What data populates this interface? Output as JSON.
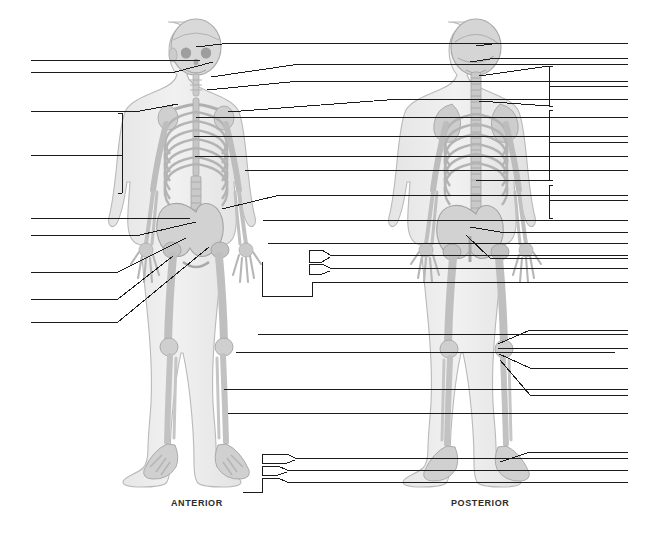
{
  "page": {
    "width": 659,
    "height": 536,
    "background_color": "#ffffff",
    "line_color": "#1a1a1a",
    "bone_fill_color": "#d4d4d4",
    "bone_outline_color": "#9a9a9a",
    "body_fill_color": "#ececec",
    "body_outline_color": "#b0b0b0"
  },
  "captions": {
    "anterior": "ANTERIOR",
    "posterior": "POSTERIOR"
  },
  "figures": [
    {
      "name": "anterior-skeleton",
      "caption": "ANTERIOR",
      "center_x": 196,
      "label_count": 22
    },
    {
      "name": "posterior-skeleton",
      "caption": "POSTERIOR",
      "center_x": 476,
      "label_count": 16
    }
  ],
  "leader_lines": {
    "left_column": [
      {
        "id": "l1",
        "answer": "",
        "x_start": 31,
        "y": 60,
        "x_end": 200,
        "target_x": 200,
        "target_y": 60
      },
      {
        "id": "l2",
        "answer": "",
        "x_start": 31,
        "y": 72,
        "x_end": 213,
        "target_x": 213,
        "target_y": 72
      },
      {
        "id": "l3",
        "answer": "",
        "x_start": 31,
        "y": 111,
        "x_end": 178,
        "target_x": 178,
        "target_y": 111
      },
      {
        "id": "l4",
        "answer": "",
        "x_start": 31,
        "y": 155,
        "x_end": 118,
        "target_x": 118,
        "target_y": 155
      },
      {
        "id": "l5",
        "answer": "",
        "x_start": 31,
        "y": 218,
        "x_end": 200,
        "target_x": 200,
        "target_y": 218
      },
      {
        "id": "l6",
        "answer": "",
        "x_start": 31,
        "y": 235,
        "x_end": 173,
        "target_x": 173,
        "target_y": 228
      },
      {
        "id": "l7",
        "answer": "",
        "x_start": 31,
        "y": 272,
        "x_end": 163,
        "target_x": 193,
        "target_y": 250
      },
      {
        "id": "l8",
        "answer": "",
        "x_start": 31,
        "y": 299,
        "x_end": 163,
        "target_x": 186,
        "target_y": 262
      },
      {
        "id": "l9",
        "answer": "",
        "x_start": 31,
        "y": 322,
        "x_end": 163,
        "target_x": 208,
        "target_y": 245
      }
    ],
    "right_column": [
      {
        "id": "r1",
        "answer": "",
        "x_end": 628,
        "y": 43,
        "x_start": 231,
        "target_x": 231,
        "target_y": 43
      },
      {
        "id": "r2",
        "answer": "",
        "x_end": 628,
        "y": 64,
        "x_start": 237,
        "target_x": 211,
        "target_y": 77
      },
      {
        "id": "r3",
        "answer": "",
        "x_end": 628,
        "y": 81,
        "x_start": 237,
        "target_x": 209,
        "target_y": 89
      },
      {
        "id": "r4",
        "answer": "",
        "x_end": 628,
        "y": 99,
        "x_start": 302,
        "target_x": 228,
        "target_y": 112
      },
      {
        "id": "r5",
        "answer": "",
        "x_end": 628,
        "y": 117,
        "x_start": 190,
        "target_x": 190,
        "target_y": 117
      },
      {
        "id": "r6",
        "answer": "",
        "x_end": 628,
        "y": 136,
        "x_start": 190,
        "target_x": 190,
        "target_y": 136
      },
      {
        "id": "r7",
        "answer": "",
        "x_end": 628,
        "y": 156,
        "x_start": 193,
        "target_x": 193,
        "target_y": 156
      },
      {
        "id": "r8",
        "answer": "",
        "x_end": 628,
        "y": 170,
        "x_start": 245,
        "target_x": 245,
        "target_y": 170
      },
      {
        "id": "r9",
        "answer": "",
        "x_end": 628,
        "y": 195,
        "x_start": 281,
        "target_x": 222,
        "target_y": 208
      },
      {
        "id": "r10",
        "answer": "",
        "x_end": 628,
        "y": 220,
        "x_start": 263,
        "target_x": 263,
        "target_y": 220
      },
      {
        "id": "r11",
        "answer": "",
        "x_end": 628,
        "y": 243,
        "x_start": 270,
        "target_x": 270,
        "target_y": 243
      },
      {
        "id": "r12",
        "answer": "",
        "x_end": 628,
        "y": 334,
        "x_start": 258,
        "target_x": 258,
        "target_y": 334
      },
      {
        "id": "r13",
        "answer": "",
        "x_end": 615,
        "y": 352,
        "x_start": 236,
        "target_x": 236,
        "target_y": 352
      },
      {
        "id": "r14",
        "answer": "",
        "x_end": 628,
        "y": 389,
        "x_start": 224,
        "target_x": 224,
        "target_y": 389
      },
      {
        "id": "r15",
        "answer": "",
        "x_end": 628,
        "y": 413,
        "x_start": 228,
        "target_x": 228,
        "target_y": 413
      },
      {
        "id": "r16",
        "answer": "",
        "x_end": 628,
        "y": 458,
        "x_start": 356,
        "target_x": 356,
        "target_y": 458
      },
      {
        "id": "r17",
        "answer": "",
        "x_end": 628,
        "y": 470,
        "x_start": 356,
        "target_x": 356,
        "target_y": 470
      },
      {
        "id": "r18",
        "answer": "",
        "x_end": 628,
        "y": 482,
        "x_start": 356,
        "target_x": 356,
        "target_y": 482
      }
    ],
    "posterior_right": [
      {
        "id": "p1",
        "answer": "",
        "x_end": 628,
        "y": 43,
        "x_start": 500
      },
      {
        "id": "p2",
        "answer": "",
        "x_end": 628,
        "y": 58,
        "x_start": 497
      },
      {
        "id": "p3",
        "answer": "",
        "x_end": 628,
        "y": 118,
        "x_start": 553
      },
      {
        "id": "p4",
        "answer": "",
        "x_end": 628,
        "y": 202,
        "x_start": 553
      },
      {
        "id": "p5",
        "answer": "",
        "x_end": 628,
        "y": 230,
        "x_start": 553
      },
      {
        "id": "p6",
        "answer": "",
        "x_end": 628,
        "y": 260,
        "x_start": 494
      },
      {
        "id": "p7",
        "answer": "",
        "x_end": 628,
        "y": 290,
        "x_start": 486
      }
    ],
    "bracket_groups": [
      {
        "name": "anterior-upper-limb-bracket",
        "x": 118,
        "y_top": 113,
        "y_bottom": 193,
        "tick_y": 155,
        "side": "left"
      },
      {
        "name": "posterior-cervical-bracket",
        "x": 553,
        "y_top": 66,
        "y_bottom": 106,
        "tick_y": 86,
        "side": "right"
      },
      {
        "name": "posterior-thoracic-bracket",
        "x": 553,
        "y_top": 110,
        "y_bottom": 180,
        "tick_y": 142,
        "side": "right"
      },
      {
        "name": "posterior-lumbar-bracket",
        "x": 553,
        "y_top": 185,
        "y_bottom": 218,
        "tick_y": 200,
        "side": "right"
      },
      {
        "name": "anterior-hand-bracket-1",
        "x": 309,
        "y_top": 252,
        "y_bottom": 262,
        "tick_y": 257,
        "side": "right"
      },
      {
        "name": "anterior-hand-bracket-2",
        "x": 309,
        "y_top": 265,
        "y_bottom": 275,
        "tick_y": 270,
        "side": "right"
      },
      {
        "name": "anterior-hand-bracket-3",
        "x": 309,
        "y_top": 268,
        "y_bottom": 296,
        "tick_y": 282,
        "side": "right"
      },
      {
        "name": "anterior-foot-bracket-1",
        "x": 262,
        "y_top": 455,
        "y_bottom": 463,
        "tick_y": 459,
        "side": "right"
      },
      {
        "name": "anterior-foot-bracket-2",
        "x": 262,
        "y_top": 466,
        "y_bottom": 475,
        "tick_y": 470,
        "side": "right"
      },
      {
        "name": "anterior-foot-bracket-3",
        "x": 262,
        "y_top": 477,
        "y_bottom": 492,
        "tick_y": 484,
        "side": "right"
      }
    ]
  },
  "answer_blanks": {
    "total": 38,
    "note": "All leader lines terminate in blank answer lines for student labeling."
  }
}
